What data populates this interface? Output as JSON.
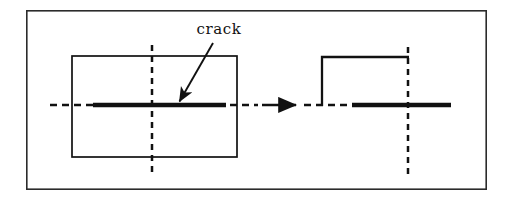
{
  "figure": {
    "domain": "Diagram",
    "caption_text": "",
    "background_color": "#ffffff",
    "ink_color": "#111111",
    "frame": {
      "name": "figure-border",
      "x": 26,
      "y": 10,
      "width": 461,
      "height": 180,
      "stroke_width": 1.6,
      "color": "#2b2b2b"
    },
    "annotations": {
      "crack_label": "crack"
    },
    "left_model": {
      "title": "full-plate-with-center-crack",
      "plate_rect": {
        "x": 72,
        "y": 56,
        "width": 165,
        "height": 101,
        "stroke_width": 1.6
      },
      "vertical_symmetry_line": {
        "x": 152,
        "y1": 45,
        "y2": 173,
        "dash": "6,5",
        "stroke_width": 2.4
      },
      "horizontal_symmetry_line": {
        "y": 105,
        "x1": 50,
        "x2": 258,
        "dash": "7,5",
        "stroke_width": 2.4
      },
      "crack_line": {
        "y": 105,
        "x1": 93,
        "x2": 226,
        "stroke_width": 4.2
      },
      "leader_line": {
        "x1": 213,
        "y1": 43,
        "x2": 178,
        "y2": 103,
        "stroke_width": 1.8,
        "arrowhead": "filled-triangle"
      },
      "label_position": {
        "x": 219,
        "y": 34,
        "anchor": "middle"
      }
    },
    "transition_arrow": {
      "name": "implies-arrow",
      "x1": 262,
      "y1": 105,
      "x2": 300,
      "y2": 105,
      "stroke_width": 2.6,
      "arrowhead": "filled-triangle"
    },
    "right_model": {
      "title": "quarter-symmetry-model",
      "left_edge": {
        "x": 322,
        "y1": 57,
        "y2": 106,
        "stroke_width": 2.2
      },
      "top_edge": {
        "y": 57,
        "x1": 321,
        "x2": 409,
        "stroke_width": 2.2
      },
      "vertical_symmetry_line": {
        "x": 408,
        "y1": 47,
        "y2": 176,
        "dash": "6,5",
        "stroke_width": 2.4
      },
      "horizontal_symmetry_line": {
        "y": 105,
        "x1": 304,
        "x2": 408,
        "dash": "7,5",
        "stroke_width": 2.4
      },
      "crack_line": {
        "y": 105,
        "x1": 352,
        "x2": 451,
        "stroke_width": 4.2
      }
    }
  }
}
